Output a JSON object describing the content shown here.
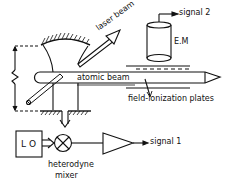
{
  "diagram": {
    "type": "experimental-setup schematic",
    "labels": {
      "laser_beam": "laser beam",
      "atomic_beam": "atomic beam",
      "signal_2": "signal 2",
      "em": "E.M",
      "field_plates": "field-ionization plates",
      "lo": "L O",
      "mixer_line1": "heterodyne",
      "mixer_line2": "mixer",
      "signal_1": "signal 1"
    },
    "components": [
      {
        "id": "curved-mirror",
        "kind": "mirror"
      },
      {
        "id": "flat-mirror",
        "kind": "mirror"
      },
      {
        "id": "atomic-beam",
        "kind": "beam"
      },
      {
        "id": "laser-beam",
        "kind": "beam"
      },
      {
        "id": "electron-multiplier",
        "kind": "detector",
        "label": "E.M"
      },
      {
        "id": "field-ionization-plates",
        "kind": "plates"
      },
      {
        "id": "local-oscillator",
        "kind": "source",
        "label": "L O"
      },
      {
        "id": "heterodyne-mixer",
        "kind": "mixer"
      },
      {
        "id": "amplifier",
        "kind": "amplifier"
      }
    ],
    "colors": {
      "ink": "#111111",
      "background": "#ffffff"
    }
  }
}
